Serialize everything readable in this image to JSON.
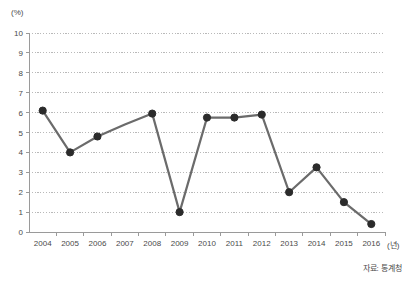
{
  "chart_data": {
    "type": "line",
    "title": "",
    "subtitle": "",
    "xlabel": "(년)",
    "ylabel": "(%)",
    "categories": [
      "2004",
      "2005",
      "2006",
      "2007",
      "2008",
      "2009",
      "2010",
      "2011",
      "2012",
      "2013",
      "2014",
      "2015",
      "2016"
    ],
    "values": [
      6.1,
      4.0,
      4.8,
      5.4,
      5.95,
      1.0,
      5.75,
      5.75,
      5.9,
      2.0,
      3.25,
      1.5,
      0.4
    ],
    "marker_visible": [
      true,
      true,
      true,
      false,
      true,
      true,
      true,
      true,
      true,
      true,
      true,
      true,
      true
    ],
    "ylim": [
      0,
      10
    ],
    "ytick_step": 1,
    "yticks": [
      "0",
      "1",
      "2",
      "3",
      "4",
      "5",
      "6",
      "7",
      "8",
      "9",
      "10"
    ],
    "grid": true,
    "grid_style": "dotted-horizontal",
    "legend": "none",
    "series_name": "",
    "annotations": []
  },
  "axes": {
    "y_unit_label": "(%)",
    "x_unit_label": "(년)"
  },
  "footer": {
    "source_note": "자료: 통계청"
  },
  "colors": {
    "line": "#6b6b6b",
    "marker": "#2b2b2b",
    "grid": "#b9b9b9",
    "axis": "#9a9a9a",
    "text": "#4a4a4a",
    "background": "#ffffff"
  }
}
